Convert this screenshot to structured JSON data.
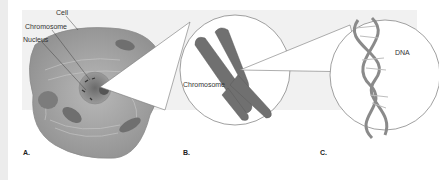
{
  "figure": {
    "panels": [
      {
        "id": "A",
        "label": "A.",
        "callouts": [
          "Cell",
          "Chromosome",
          "Nucleus"
        ]
      },
      {
        "id": "B",
        "label": "B.",
        "callouts": [
          "Chromosome"
        ]
      },
      {
        "id": "C",
        "label": "C.",
        "callouts": [
          "DNA"
        ]
      }
    ],
    "labels": {
      "cell": "Cell",
      "chromosome_a": "Chromosome",
      "nucleus": "Nucleus",
      "chromosome_b": "Chromosome",
      "dna": "DNA",
      "panel_a": "A.",
      "panel_b": "B.",
      "panel_c": "C."
    },
    "colors": {
      "background": "#ffffff",
      "band": "#f1f1f1",
      "cell_fill": "#a9a9a9",
      "chromosome_fill": "#6e6e6e",
      "outline": "#777777"
    }
  }
}
